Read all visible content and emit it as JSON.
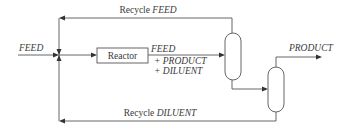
{
  "diagram": {
    "type": "process-flow",
    "nodes": {
      "reactor": {
        "label": "Reactor"
      },
      "separator_1": {
        "label": ""
      },
      "separator_2": {
        "label": ""
      },
      "mixing_junction": {
        "label": ""
      }
    },
    "streams": {
      "feed_in": {
        "label": "FEED"
      },
      "reactor_out": {
        "line1": "FEED",
        "line2": "+ PRODUCT",
        "line3": "+ DILUENT"
      },
      "product_out": {
        "label": "PRODUCT"
      },
      "recycle_feed": {
        "prefix": "Recycle ",
        "label": "FEED"
      },
      "recycle_diluent": {
        "prefix": "Recycle ",
        "label": "DILUENT"
      }
    },
    "edges": [
      {
        "from": "feed_in",
        "to": "mixing_junction"
      },
      {
        "from": "mixing_junction",
        "to": "reactor"
      },
      {
        "from": "reactor",
        "to": "separator_1"
      },
      {
        "from": "separator_1",
        "to": "mixing_junction",
        "stream": "recycle_feed"
      },
      {
        "from": "separator_1",
        "to": "separator_2"
      },
      {
        "from": "separator_2",
        "to": "product_out"
      },
      {
        "from": "separator_2",
        "to": "mixing_junction",
        "stream": "recycle_diluent"
      }
    ]
  }
}
